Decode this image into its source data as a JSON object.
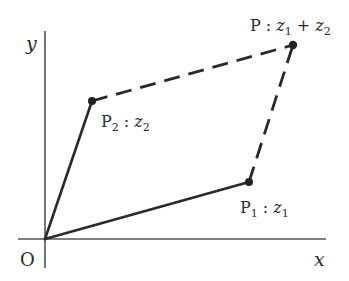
{
  "diagram": {
    "axes": {
      "x_label": "x",
      "y_label": "y",
      "origin_label": "O"
    },
    "points": {
      "p1": {
        "name": "P",
        "subscript": "1",
        "sep": " : ",
        "var": "z",
        "var_sub": "1"
      },
      "p2": {
        "name": "P",
        "subscript": "2",
        "sep": " : ",
        "var": "z",
        "var_sub": "2"
      },
      "p": {
        "name": "P",
        "sep": " : ",
        "var1": "z",
        "var1_sub": "1",
        "op": " + ",
        "var2": "z",
        "var2_sub": "2"
      }
    },
    "colors": {
      "line": "#2a2a2a",
      "axis": "#555555",
      "background": "#ffffff"
    }
  }
}
